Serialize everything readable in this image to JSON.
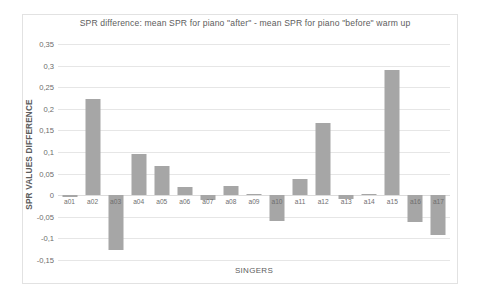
{
  "chart_data": {
    "type": "bar",
    "title": "SPR difference:  mean SPR for piano \"after\"  - mean SPR for piano \"before\"  warm up",
    "xlabel": "SINGERS",
    "ylabel": "SPR VALUES DIFFERENCE",
    "categories": [
      "a01",
      "a02",
      "a03",
      "a04",
      "a05",
      "a06",
      "a07",
      "a08",
      "a09",
      "a10",
      "a11",
      "a12",
      "a13",
      "a14",
      "a15",
      "a16",
      "a17"
    ],
    "values": [
      -0.005,
      0.222,
      -0.127,
      0.096,
      0.067,
      0.02,
      -0.012,
      0.022,
      0.002,
      -0.06,
      0.038,
      0.168,
      -0.008,
      0.003,
      0.29,
      -0.062,
      -0.093
    ],
    "ylim": [
      -0.15,
      0.35
    ],
    "ytick_labels": [
      "0,35",
      "0,3",
      "0,25",
      "0,2",
      "0,15",
      "0,1",
      "0,05",
      "0",
      "-0,05",
      "-0,1",
      "-0,15"
    ],
    "ytick_values": [
      0.35,
      0.3,
      0.25,
      0.2,
      0.15,
      0.1,
      0.05,
      0,
      -0.05,
      -0.1,
      -0.15
    ],
    "grid": true,
    "legend": "none",
    "bar_color": "#a6a6a6",
    "gridline_color": "#e6e6e6",
    "text_color": "#5d5d5d"
  }
}
